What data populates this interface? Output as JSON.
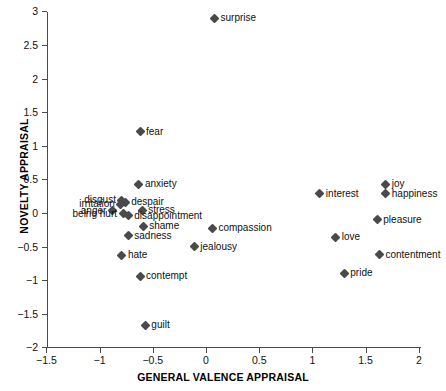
{
  "chart_data": {
    "type": "scatter",
    "title": "",
    "xlabel": "GENERAL VALENCE APPRAISAL",
    "ylabel": "NOVELTY APPRAISAL",
    "xlim": [
      -1.5,
      2
    ],
    "ylim": [
      -2,
      3
    ],
    "xticks": [
      -1.5,
      -1,
      -0.5,
      0,
      0.5,
      1,
      1.5,
      2
    ],
    "xtick_labels": [
      "−1.5",
      "−1",
      "−0.5",
      "0",
      "0.5",
      "1",
      "1.5",
      "2"
    ],
    "yticks": [
      3,
      2.5,
      2,
      1.5,
      1,
      0.5,
      0,
      -0.5,
      -1,
      -1.5,
      -2
    ],
    "ytick_labels": [
      "3",
      "2.5",
      "2",
      "1.5",
      "1",
      "0.5",
      "0",
      "−0.5",
      "−1",
      "−1.5",
      "−2"
    ],
    "grid": false,
    "legend": "none",
    "marker": "diamond",
    "marker_color": "#4a4a4a",
    "points": [
      {
        "label": "surprise",
        "x": 0.08,
        "y": 2.9,
        "label_pos": "right"
      },
      {
        "label": "fear",
        "x": -0.62,
        "y": 1.21,
        "label_pos": "right"
      },
      {
        "label": "anxiety",
        "x": -0.63,
        "y": 0.43,
        "label_pos": "right"
      },
      {
        "label": "joy",
        "x": 1.69,
        "y": 0.43,
        "label_pos": "right"
      },
      {
        "label": "happiness",
        "x": 1.69,
        "y": 0.29,
        "label_pos": "right"
      },
      {
        "label": "interest",
        "x": 1.07,
        "y": 0.29,
        "label_pos": "right"
      },
      {
        "label": "disgust",
        "x": -0.79,
        "y": 0.19,
        "label_pos": "left"
      },
      {
        "label": "despair",
        "x": -0.76,
        "y": 0.16,
        "label_pos": "right"
      },
      {
        "label": "irritation",
        "x": -0.8,
        "y": 0.13,
        "label_pos": "left"
      },
      {
        "label": "anger",
        "x": -0.88,
        "y": 0.03,
        "label_pos": "left"
      },
      {
        "label": "stress",
        "x": -0.6,
        "y": 0.04,
        "label_pos": "right"
      },
      {
        "label": "being hurt",
        "x": -0.78,
        "y": -0.01,
        "label_pos": "left"
      },
      {
        "label": "disappointment",
        "x": -0.73,
        "y": -0.04,
        "label_pos": "right"
      },
      {
        "label": "pleasure",
        "x": 1.61,
        "y": -0.1,
        "label_pos": "right"
      },
      {
        "label": "shame",
        "x": -0.59,
        "y": -0.2,
        "label_pos": "right"
      },
      {
        "label": "compassion",
        "x": 0.06,
        "y": -0.23,
        "label_pos": "right"
      },
      {
        "label": "love",
        "x": 1.22,
        "y": -0.36,
        "label_pos": "right"
      },
      {
        "label": "sadness",
        "x": -0.73,
        "y": -0.34,
        "label_pos": "right"
      },
      {
        "label": "jealousy",
        "x": -0.11,
        "y": -0.5,
        "label_pos": "right"
      },
      {
        "label": "contentment",
        "x": 1.63,
        "y": -0.62,
        "label_pos": "right"
      },
      {
        "label": "hate",
        "x": -0.79,
        "y": -0.63,
        "label_pos": "right"
      },
      {
        "label": "pride",
        "x": 1.3,
        "y": -0.9,
        "label_pos": "right"
      },
      {
        "label": "contempt",
        "x": -0.62,
        "y": -0.94,
        "label_pos": "right"
      },
      {
        "label": "guilt",
        "x": -0.57,
        "y": -1.67,
        "label_pos": "right"
      }
    ]
  }
}
